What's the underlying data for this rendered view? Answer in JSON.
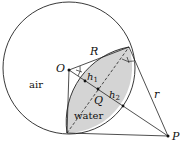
{
  "diagram": {
    "labels": {
      "O": "O",
      "R": "R",
      "h1_main": "h",
      "h1_sub": "1",
      "h2_main": "h",
      "h2_sub": "2",
      "Q": "Q",
      "r": "r",
      "P": "P",
      "air": "air",
      "water": "water"
    },
    "colors": {
      "stroke": "#222222",
      "water_fill": "#d4d4d4",
      "background": "#ffffff"
    }
  }
}
